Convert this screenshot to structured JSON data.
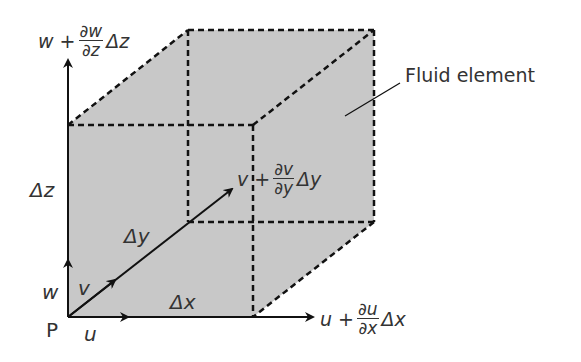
{
  "diagram": {
    "fill_color": "#c8c8c8",
    "line_color": "#111111",
    "labels": {
      "point": "P",
      "u": "u",
      "v": "v",
      "w": "w",
      "dx": "Δx",
      "dy": "Δy",
      "dz": "Δz",
      "fluid_element": "Fluid element",
      "u_out": {
        "base": "u",
        "op": "+",
        "num": "∂u",
        "den": "∂x",
        "delta": "Δx"
      },
      "v_out": {
        "base": "v",
        "op": "+",
        "num": "∂v",
        "den": "∂y",
        "delta": "Δy"
      },
      "w_out": {
        "base": "w",
        "op": "+",
        "num": "∂w",
        "den": "∂z",
        "delta": "Δz"
      }
    }
  }
}
